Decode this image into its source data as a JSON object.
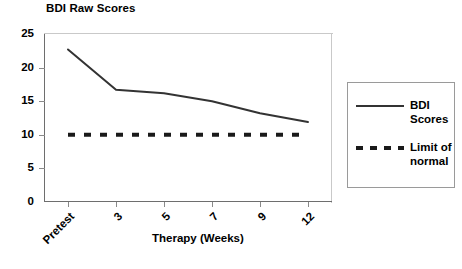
{
  "chart_data": {
    "type": "line",
    "title": "BDI Raw Scores",
    "xlabel": "Therapy (Weeks)",
    "ylabel": "",
    "categories": [
      "Pretest",
      "3",
      "5",
      "7",
      "9",
      "12"
    ],
    "yticks": [
      "0",
      "5",
      "10",
      "15",
      "20",
      "25"
    ],
    "ylim": [
      0,
      25
    ],
    "grid": false,
    "legend_position": "right-outside",
    "series": [
      {
        "name": "BDI Scores",
        "style": "solid",
        "color": "#333333",
        "values": [
          22.7,
          16.7,
          16.2,
          15.0,
          13.2,
          11.9
        ]
      },
      {
        "name": "Limit of normal",
        "style": "dashed",
        "color": "#1a1a1a",
        "values": [
          10,
          10,
          10,
          10,
          10,
          10
        ]
      }
    ]
  },
  "legend": {
    "entries": [
      {
        "label_line1": "BDI",
        "label_line2": "Scores"
      },
      {
        "label_line1": "Limit of",
        "label_line2": "normal"
      }
    ]
  }
}
